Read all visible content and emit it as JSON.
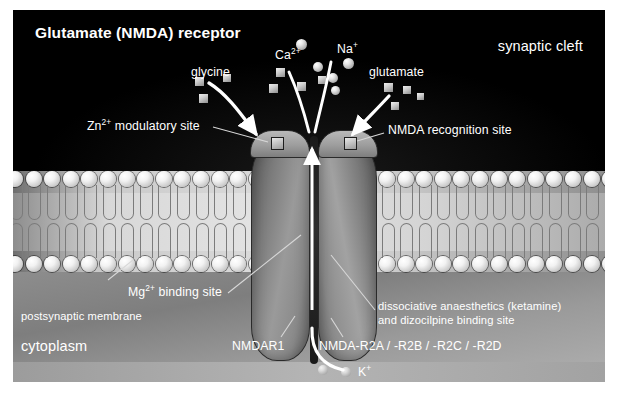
{
  "figure": {
    "title": "Glutamate (NMDA) receptor",
    "zones": {
      "cleft": "synaptic cleft",
      "membrane": "postsynaptic membrane",
      "cytoplasm": "cytoplasm"
    },
    "ligands": [
      {
        "name": "glycine",
        "label": "glycine",
        "shape": "square"
      },
      {
        "name": "calcium",
        "label": "Ca2+",
        "label_base": "Ca",
        "label_sup": "2+",
        "shape": "sphere"
      },
      {
        "name": "sodium",
        "label": "Na+",
        "label_base": "Na",
        "label_sup": "+",
        "shape": "sphere"
      },
      {
        "name": "glutamate",
        "label": "glutamate",
        "shape": "square"
      },
      {
        "name": "potassium",
        "label": "K+",
        "label_base": "K",
        "label_sup": "+",
        "shape": "sphere"
      }
    ],
    "binding_sites": [
      {
        "name": "zinc-modulatory-site",
        "base": "Zn",
        "sup": "2+",
        "rest": " modulatory site"
      },
      {
        "name": "nmda-recognition-site",
        "text": "NMDA recognition site"
      },
      {
        "name": "magnesium-binding-site",
        "base": "Mg",
        "sup": "2+",
        "rest": " binding site"
      },
      {
        "name": "dissociative-anaesthetic-site",
        "line1": "dissociative anaesthetics (ketamine)",
        "line2": "and dizocilpine binding site"
      }
    ],
    "subunits": [
      {
        "name": "nmdar1",
        "label": "NMDAR1"
      },
      {
        "name": "nmda-r2-family",
        "label": "NMDA-R2A / -R2B / -R2C / -R2D"
      }
    ],
    "colors": {
      "cleft_bg": "#000000",
      "membrane": "#d4d4d4",
      "cytoplasm": "#8a8a8a",
      "text": "#ffffff",
      "receptor": "#8e8e8e",
      "leader": "#d8d8d8"
    }
  }
}
